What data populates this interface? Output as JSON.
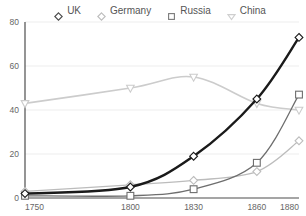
{
  "legend": {
    "position": "top",
    "items": [
      {
        "label": "UK",
        "marker": "diamond-marker",
        "color": "#1a1a1a"
      },
      {
        "label": "Germany",
        "marker": "diamond-open-marker",
        "color": "#bcbcbc"
      },
      {
        "label": "Russia",
        "marker": "square-open-marker",
        "color": "#6e6e6e"
      },
      {
        "label": "China",
        "marker": "triangle-down-marker",
        "color": "#cccccc"
      }
    ]
  },
  "axes": {
    "y_ticks": [
      "0",
      "20",
      "40",
      "60",
      "80"
    ],
    "x_ticks": [
      "1750",
      "1800",
      "1830",
      "1860",
      "1880"
    ]
  },
  "chart_data": {
    "type": "line",
    "title": "",
    "subtitle": "",
    "xlabel": "",
    "ylabel": "",
    "x": [
      1750,
      1800,
      1830,
      1860,
      1880
    ],
    "categories": [
      "1750",
      "1800",
      "1830",
      "1860",
      "1880"
    ],
    "xlim": [
      1750,
      1880
    ],
    "ylim": [
      0,
      80
    ],
    "grid": true,
    "grid_axis": "y",
    "legend_position": "top",
    "series": [
      {
        "name": "UK",
        "color": "#1a1a1a",
        "marker": "diamond-marker",
        "line_width": 2.4,
        "values": [
          2,
          5,
          19,
          45,
          73
        ]
      },
      {
        "name": "Germany",
        "color": "#bcbcbc",
        "marker": "diamond-open-marker",
        "line_width": 1.3,
        "values": [
          3,
          6,
          8,
          12,
          26
        ]
      },
      {
        "name": "Russia",
        "color": "#6e6e6e",
        "marker": "square-open-marker",
        "line_width": 1.3,
        "values": [
          1,
          1,
          4,
          16,
          47
        ]
      },
      {
        "name": "China",
        "color": "#cccccc",
        "marker": "triangle-down-marker",
        "line_width": 1.6,
        "values": [
          43,
          50,
          55,
          43,
          40
        ]
      }
    ]
  },
  "colors": {
    "axis": "#4d4d4d",
    "grid": "#ededed",
    "tick_text": "#666666",
    "background": "#ffffff"
  }
}
